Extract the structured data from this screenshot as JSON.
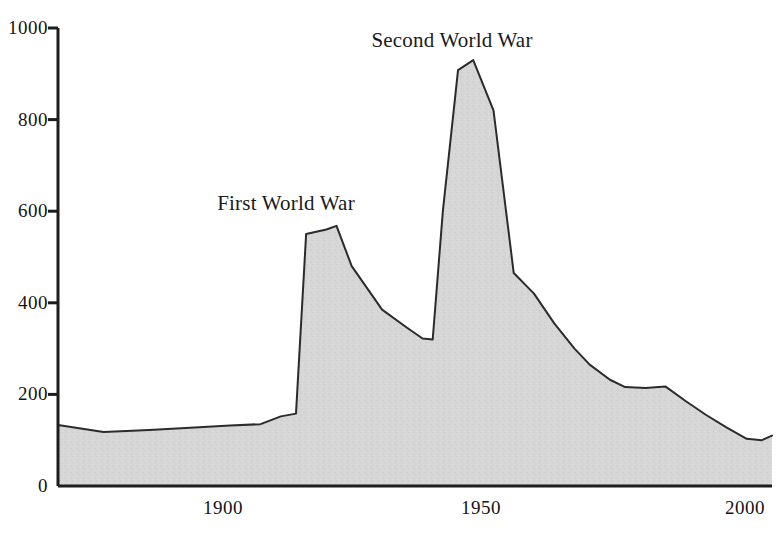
{
  "chart_data": {
    "type": "area",
    "title": "",
    "xlabel": "",
    "ylabel": "",
    "xlim": [
      1866,
      2007
    ],
    "ylim": [
      0,
      1000
    ],
    "grid": false,
    "legend": "none",
    "x_ticks": [
      "1900",
      "1950",
      "2000"
    ],
    "x_tick_values": [
      1900,
      1950,
      2000
    ],
    "y_ticks": [
      "0",
      "200",
      "400",
      "600",
      "800",
      "1000"
    ],
    "y_tick_values": [
      0,
      200,
      400,
      600,
      800,
      1000
    ],
    "annotations": [
      {
        "text": "First World War",
        "x": 1912,
        "y": 640
      },
      {
        "text": "Second World War",
        "x": 1944,
        "y": 1000
      }
    ],
    "series": [
      {
        "name": "value",
        "fill_color": "#d5d5d5",
        "line_color": "#2b2b2b",
        "x": [
          1866,
          1875,
          1884,
          1893,
          1900,
          1906,
          1910,
          1913,
          1915,
          1919,
          1921,
          1924,
          1930,
          1935,
          1938,
          1940,
          1942,
          1945,
          1948,
          1952,
          1956,
          1960,
          1964,
          1968,
          1971,
          1975,
          1978,
          1982,
          1986,
          1990,
          1994,
          1998,
          2002,
          2005,
          2007
        ],
        "values": [
          133,
          118,
          122,
          128,
          132,
          135,
          152,
          158,
          550,
          560,
          568,
          480,
          385,
          345,
          322,
          320,
          600,
          908,
          930,
          820,
          465,
          420,
          355,
          300,
          265,
          232,
          216,
          214,
          217,
          185,
          155,
          128,
          103,
          100,
          110
        ]
      }
    ]
  }
}
